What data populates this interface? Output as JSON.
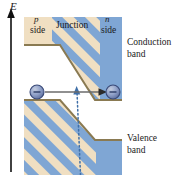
{
  "figure": {
    "kind": "pn-junction-energy-band-diagram",
    "width": 184,
    "height": 175,
    "background": "#ffffff"
  },
  "axis": {
    "label": "E",
    "name": "energy-axis",
    "direction": "up",
    "x": 11,
    "y_top": 10,
    "y_bottom": 172
  },
  "regions": {
    "p_side": {
      "marker": "p",
      "label": "side",
      "fill": "#f0dfc2"
    },
    "junction": {
      "label": "Junction",
      "hatch_fill": "#7fa6d4",
      "hatch_stripe": "#f0dfc2"
    },
    "n_side": {
      "marker": "n",
      "label": "side",
      "fill": "#7fa6d4"
    }
  },
  "bands": {
    "conduction": {
      "line1": "Conduction",
      "line2": "band",
      "edge_color": "#8a7a52"
    },
    "valence": {
      "line1": "Valence",
      "line2": "band",
      "edge_color": "#8a7a52"
    }
  },
  "particles": [
    {
      "name": "electron-p-side",
      "symbol": "minus",
      "cx": 37,
      "cy": 92,
      "r": 7,
      "fill": "#8fa0c8",
      "stroke": "#3a4a78"
    },
    {
      "name": "electron-n-side",
      "symbol": "minus",
      "cx": 113,
      "cy": 92,
      "r": 7,
      "fill": "#8fa0c8",
      "stroke": "#3a4a78"
    }
  ],
  "arrows": {
    "tunneling": {
      "name": "tunneling-arrow",
      "style": "solid",
      "color": "#6b6b6b",
      "x1": 45,
      "y1": 92,
      "x2": 106,
      "y2": 92
    },
    "photon": {
      "name": "photon-arrow",
      "style": "dotted",
      "color": "#3f6fa8",
      "x1": 80,
      "y1": 175,
      "x2": 77,
      "y2": 88
    }
  },
  "colors": {
    "tan": "#f0dfc2",
    "blue": "#7fa6d4",
    "band_edge": "#8a7a52",
    "text": "#1a1a1a"
  }
}
